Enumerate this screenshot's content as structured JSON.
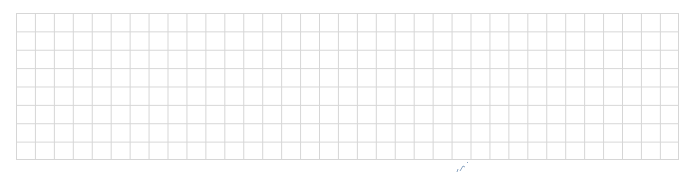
{
  "grid": {
    "columns": 35,
    "rows": 8,
    "line_color": "#d6d6d6",
    "background": "#ffffff"
  },
  "mark": {
    "icon": "pen-scribble",
    "color": "#5a7fa8"
  }
}
